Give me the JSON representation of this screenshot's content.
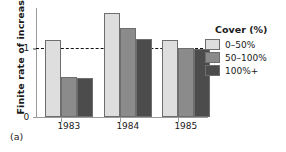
{
  "panel_label": "(a)",
  "legend": {
    "title": "Cover (%)",
    "entries": [
      {
        "label": "0–50%",
        "color": "#dedede"
      },
      {
        "label": "50–100%",
        "color": "#8b8b8b"
      },
      {
        "label": "100%+",
        "color": "#4c4c4c"
      }
    ]
  },
  "axes": {
    "y_title": "Finite rate of increase",
    "y_ticks": [
      "0",
      "1"
    ],
    "x_ticks": [
      "1983",
      "1984",
      "1985"
    ]
  },
  "chart_data": {
    "type": "bar",
    "title": "",
    "xlabel": "",
    "ylabel": "Finite rate of increase",
    "categories": [
      "1983",
      "1984",
      "1985"
    ],
    "series": [
      {
        "name": "0–50%",
        "color": "#dedede",
        "values": [
          1.12,
          1.52,
          1.12
        ]
      },
      {
        "name": "50–100%",
        "color": "#8b8b8b",
        "values": [
          0.58,
          1.29,
          1.01
        ]
      },
      {
        "name": "100%+",
        "color": "#4c4c4c",
        "values": [
          0.57,
          1.14,
          0.99
        ]
      }
    ],
    "ylim": [
      0,
      1.59
    ],
    "ytick_values": [
      0,
      1
    ],
    "grid": false,
    "reference_line": {
      "value": 1,
      "style": "dashed",
      "color": "#111111"
    },
    "legend_position": "right",
    "legend_title": "Cover (%)"
  }
}
